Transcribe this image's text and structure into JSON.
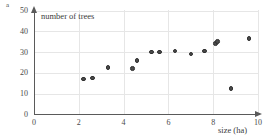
{
  "figure": {
    "part_label": "a"
  },
  "chart_data": {
    "type": "scatter",
    "title": "",
    "xlabel": "size (ha)",
    "ylabel": "number of trees",
    "xlim": [
      0,
      10
    ],
    "ylim": [
      0,
      50
    ],
    "xticks": [
      0,
      2,
      4,
      6,
      8,
      10
    ],
    "yticks": [
      0,
      10,
      20,
      30,
      40,
      50
    ],
    "xtick_labels": [
      "0",
      "2",
      "4",
      "6",
      "8",
      "10"
    ],
    "ytick_labels": [
      "0",
      "10",
      "20",
      "30",
      "40",
      "50"
    ],
    "grid": true,
    "legend": null,
    "x": [
      2.2,
      2.6,
      3.3,
      4.4,
      4.6,
      5.25,
      6.3,
      6.3,
      7.0,
      7.6,
      8.2,
      8.8,
      9.7,
      8.8
    ],
    "y": [
      16.5,
      17.5,
      22.5,
      21.5,
      26,
      30,
      30,
      30,
      29,
      30.5,
      34,
      36.5,
      36.5,
      12.5
    ],
    "points": [
      {
        "size": 2.2,
        "trees": 17
      },
      {
        "size": 2.6,
        "trees": 17.5
      },
      {
        "size": 3.3,
        "trees": 22.5
      },
      {
        "size": 4.4,
        "trees": 22
      },
      {
        "size": 4.6,
        "trees": 26
      },
      {
        "size": 5.25,
        "trees": 30
      },
      {
        "size": 5.6,
        "trees": 30
      },
      {
        "size": 6.3,
        "trees": 30.5
      },
      {
        "size": 7.0,
        "trees": 29
      },
      {
        "size": 7.6,
        "trees": 30.5
      },
      {
        "size": 8.1,
        "trees": 34
      },
      {
        "size": 8.2,
        "trees": 35
      },
      {
        "size": 9.6,
        "trees": 36.5
      },
      {
        "size": 8.8,
        "trees": 12.5
      }
    ]
  }
}
